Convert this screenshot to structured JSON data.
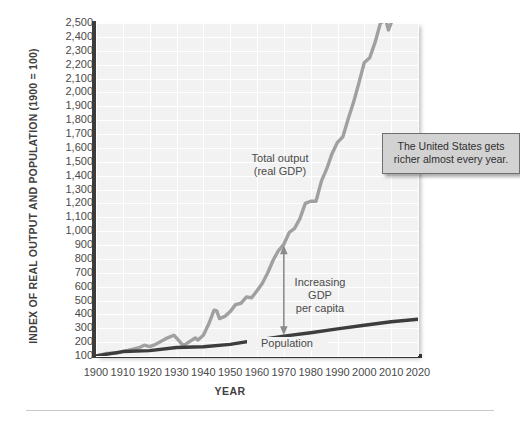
{
  "figure": {
    "y_axis_title": "INDEX OF REAL OUTPUT AND POPULATION (1900 = 100)",
    "x_axis_title": "YEAR",
    "callout_text": "The United States gets richer almost every year.",
    "annotation_gdp": "Total output\n(real GDP)",
    "annotation_percapita": "Increasing\nGDP\nper capita",
    "annotation_population": "Population",
    "colors": {
      "gdp_line": "#a0a0a0",
      "population_line": "#3d3d3d",
      "plot_background": "#f2f2f2",
      "gridline": "#ffffff",
      "axis": "#3d3d3d",
      "callout_background": "#d2d2d2",
      "callout_border": "#6e6e6e"
    }
  },
  "chart_data": {
    "type": "line",
    "title": "",
    "xlabel": "YEAR",
    "ylabel": "INDEX OF REAL OUTPUT AND POPULATION (1900 = 100)",
    "xlim": [
      1900,
      2020
    ],
    "ylim": [
      100,
      2500
    ],
    "ytick_labels": [
      "2,500",
      "2,400",
      "2,300",
      "2,200",
      "2,100",
      "2,000",
      "1,900",
      "1,800",
      "1,700",
      "1,600",
      "1,500",
      "1,400",
      "1,300",
      "1,200",
      "1,100",
      "1,000",
      "900",
      "800",
      "700",
      "600",
      "500",
      "400",
      "300",
      "200",
      "100"
    ],
    "ytick_values": [
      2500,
      2400,
      2300,
      2200,
      2100,
      2000,
      1900,
      1800,
      1700,
      1600,
      1500,
      1400,
      1300,
      1200,
      1100,
      1000,
      900,
      800,
      700,
      600,
      500,
      400,
      300,
      200,
      100
    ],
    "xtick_labels": [
      "1900",
      "1910",
      "1920",
      "1930",
      "1940",
      "1950",
      "1960",
      "1970",
      "1980",
      "1990",
      "2000",
      "2010",
      "2020"
    ],
    "xtick_values": [
      1900,
      1910,
      1920,
      1930,
      1940,
      1950,
      1960,
      1970,
      1980,
      1990,
      2000,
      2010,
      2020
    ],
    "grid": true,
    "legend_position": "inline-annotations",
    "series": [
      {
        "name": "Total output (real GDP)",
        "color": "#a0a0a0",
        "x": [
          1900,
          1904,
          1908,
          1912,
          1916,
          1918,
          1920,
          1922,
          1926,
          1929,
          1930,
          1932,
          1933,
          1935,
          1937,
          1938,
          1940,
          1942,
          1944,
          1945,
          1946,
          1948,
          1950,
          1952,
          1954,
          1956,
          1958,
          1960,
          1962,
          1964,
          1966,
          1968,
          1970,
          1972,
          1974,
          1976,
          1978,
          1980,
          1982,
          1984,
          1986,
          1988,
          1990,
          1992,
          1994,
          1996,
          1998,
          2000,
          2002,
          2004,
          2006,
          2008,
          2009,
          2010,
          2012,
          2014,
          2016,
          2018,
          2020
        ],
        "y": [
          100,
          118,
          122,
          140,
          160,
          178,
          168,
          182,
          225,
          250,
          230,
          185,
          180,
          205,
          230,
          215,
          250,
          330,
          430,
          425,
          370,
          385,
          420,
          470,
          480,
          525,
          520,
          570,
          625,
          700,
          790,
          860,
          905,
          990,
          1020,
          1090,
          1200,
          1215,
          1215,
          1360,
          1450,
          1560,
          1640,
          1680,
          1810,
          1930,
          2070,
          2215,
          2250,
          2360,
          2500,
          2520,
          2450,
          2500,
          2570,
          2665,
          2760,
          2890,
          2850
        ],
        "y_display_note": "Curve rises from 100 in 1900 to about 2,400 by 2010-2020, with a sharp dip in the early 1930s (Great Depression) and a wartime spike in the 1940s."
      },
      {
        "name": "Population",
        "color": "#3d3d3d",
        "x": [
          1900,
          1910,
          1920,
          1930,
          1940,
          1950,
          1960,
          1970,
          1980,
          1990,
          2000,
          2010,
          2020
        ],
        "y": [
          100,
          132,
          139,
          161,
          167,
          184,
          214,
          243,
          268,
          295,
          322,
          347,
          365
        ],
        "y_display_note": "Population index grows smoothly from 100 in 1900 to roughly 330 by 2020."
      }
    ],
    "annotations": [
      {
        "text": "Total output (real GDP)",
        "x": 1968,
        "y": 1430
      },
      {
        "text": "Increasing GDP per capita",
        "x": 1988,
        "y": 600,
        "arrow": "double-headed vertical arrow at 1970 between the population line (~240) and the real GDP line (~900)"
      },
      {
        "text": "Population",
        "x": 1975,
        "y": 180
      },
      {
        "text": "The United States gets richer almost every year.",
        "x": 2008,
        "y": 1680,
        "style": "callout-box"
      }
    ]
  }
}
